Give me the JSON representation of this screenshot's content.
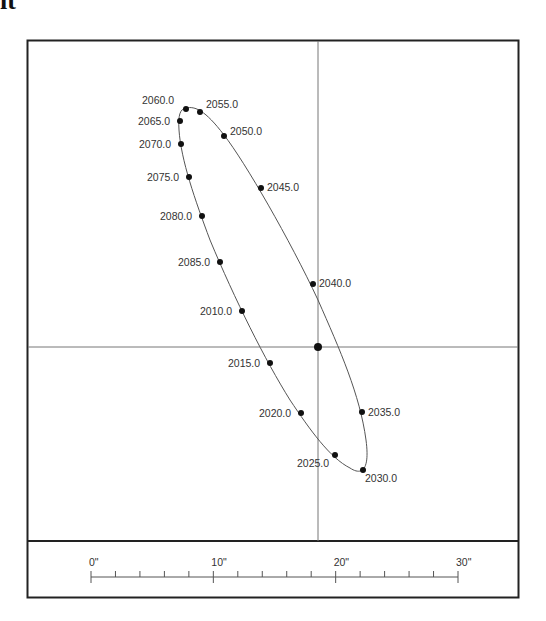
{
  "corner_text": "it",
  "chart_data": {
    "type": "scatter",
    "title": "",
    "xlabel": "",
    "ylabel": "",
    "grid": false,
    "primary_star": {
      "x": 318,
      "y": 347
    },
    "points": [
      {
        "label": "2010.0",
        "x": 242,
        "y": 311
      },
      {
        "label": "2015.0",
        "x": 270,
        "y": 363
      },
      {
        "label": "2020.0",
        "x": 301,
        "y": 413
      },
      {
        "label": "2025.0",
        "x": 335,
        "y": 455
      },
      {
        "label": "2030.0",
        "x": 363,
        "y": 470
      },
      {
        "label": "2035.0",
        "x": 362,
        "y": 412
      },
      {
        "label": "2040.0",
        "x": 313,
        "y": 284
      },
      {
        "label": "2045.0",
        "x": 261,
        "y": 188
      },
      {
        "label": "2050.0",
        "x": 224,
        "y": 136
      },
      {
        "label": "2055.0",
        "x": 200,
        "y": 112
      },
      {
        "label": "2060.0",
        "x": 186,
        "y": 109
      },
      {
        "label": "2065.0",
        "x": 180,
        "y": 121
      },
      {
        "label": "2070.0",
        "x": 181,
        "y": 144
      },
      {
        "label": "2075.0",
        "x": 189,
        "y": 177
      },
      {
        "label": "2080.0",
        "x": 202,
        "y": 216
      },
      {
        "label": "2085.0",
        "x": 220,
        "y": 262
      }
    ],
    "scale_bar": {
      "unit": "arcseconds",
      "tick_labels": [
        "0\"",
        "10\"",
        "20\"",
        "30\""
      ],
      "major_values": [
        0,
        10,
        20,
        30
      ],
      "minor_step": 2,
      "range": [
        0,
        30
      ]
    }
  }
}
